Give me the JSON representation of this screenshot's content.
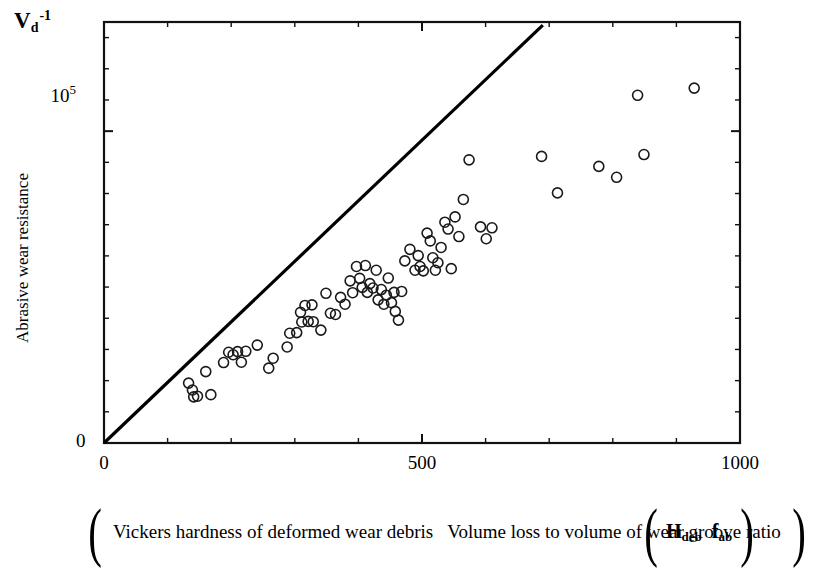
{
  "figure": {
    "corner_symbol": {
      "base": "V",
      "subscript": "d",
      "superscript": "-1"
    },
    "y_axis_title": "Abrasive wear resistance",
    "x_axis_expression": {
      "open_paren": "(",
      "numerator": "Vickers hardness of deformed wear debris",
      "denominator": "Volume loss to volume of wear groove ratio",
      "close_paren": ")"
    },
    "x_axis_symbol": {
      "open_paren": "(",
      "numerator_base": "H",
      "numerator_sub": "deb",
      "denominator_base": "f",
      "denominator_sub": "ab",
      "close_paren": ")"
    }
  },
  "chart_data": {
    "type": "scatter",
    "title": "",
    "subtitle": "",
    "xlabel": "Vickers hardness of deformed wear debris / Volume loss to volume of wear groove ratio (H_deb / f_ab)",
    "ylabel": "Abrasive wear resistance (V_d^-1)",
    "xlim": [
      0,
      1000
    ],
    "ylim": [
      0,
      135000
    ],
    "grid": false,
    "legend": null,
    "x_ticks": [
      {
        "value": 0,
        "label": "0",
        "major": true
      },
      {
        "value": 100,
        "label": "",
        "major": false
      },
      {
        "value": 200,
        "label": "",
        "major": false
      },
      {
        "value": 300,
        "label": "",
        "major": false
      },
      {
        "value": 400,
        "label": "",
        "major": false
      },
      {
        "value": 500,
        "label": "500",
        "major": true
      },
      {
        "value": 600,
        "label": "",
        "major": false
      },
      {
        "value": 700,
        "label": "",
        "major": false
      },
      {
        "value": 800,
        "label": "",
        "major": false
      },
      {
        "value": 900,
        "label": "",
        "major": false
      },
      {
        "value": 1000,
        "label": "1000",
        "major": true
      }
    ],
    "y_ticks": [
      {
        "value": 0,
        "label": "0",
        "major": true
      },
      {
        "value": 10000,
        "label": "",
        "major": false
      },
      {
        "value": 20000,
        "label": "",
        "major": false
      },
      {
        "value": 30000,
        "label": "",
        "major": false
      },
      {
        "value": 40000,
        "label": "",
        "major": false
      },
      {
        "value": 50000,
        "label": "",
        "major": false
      },
      {
        "value": 60000,
        "label": "",
        "major": false
      },
      {
        "value": 70000,
        "label": "",
        "major": false
      },
      {
        "value": 80000,
        "label": "",
        "major": false
      },
      {
        "value": 90000,
        "label": "",
        "major": false
      },
      {
        "value": 100000,
        "label": "10^5",
        "major": true
      },
      {
        "value": 110000,
        "label": "",
        "major": false
      },
      {
        "value": 120000,
        "label": "",
        "major": false
      },
      {
        "value": 130000,
        "label": "",
        "major": false
      }
    ],
    "y_tick_1e5_label": {
      "mantissa": "10",
      "exponent": "5"
    },
    "trend_line": {
      "label": "linear fit through origin",
      "x_start": 0,
      "y_start": 0,
      "x_end": 690,
      "y_end": 134000,
      "color": "#000000",
      "width": 3.2
    },
    "marker": {
      "shape": "open-circle",
      "radius": 5,
      "stroke": "#1a1a1a",
      "stroke_width": 1.6,
      "fill": "none"
    },
    "points": [
      [
        133,
        19200
      ],
      [
        139,
        17000
      ],
      [
        141,
        14800
      ],
      [
        147,
        15000
      ],
      [
        160,
        22900
      ],
      [
        168,
        15500
      ],
      [
        188,
        25800
      ],
      [
        196,
        29100
      ],
      [
        203,
        28300
      ],
      [
        210,
        29300
      ],
      [
        216,
        25900
      ],
      [
        223,
        29400
      ],
      [
        241,
        31400
      ],
      [
        259,
        24000
      ],
      [
        266,
        27200
      ],
      [
        288,
        30800
      ],
      [
        292,
        35200
      ],
      [
        303,
        35400
      ],
      [
        309,
        41900
      ],
      [
        311,
        38800
      ],
      [
        316,
        44100
      ],
      [
        321,
        39000
      ],
      [
        327,
        44300
      ],
      [
        329,
        38900
      ],
      [
        341,
        36200
      ],
      [
        349,
        48000
      ],
      [
        356,
        41600
      ],
      [
        364,
        41200
      ],
      [
        372,
        46700
      ],
      [
        379,
        44500
      ],
      [
        387,
        52000
      ],
      [
        391,
        48200
      ],
      [
        397,
        56600
      ],
      [
        402,
        52800
      ],
      [
        406,
        49900
      ],
      [
        411,
        56900
      ],
      [
        414,
        48300
      ],
      [
        418,
        51100
      ],
      [
        423,
        49700
      ],
      [
        428,
        55400
      ],
      [
        431,
        45900
      ],
      [
        436,
        49200
      ],
      [
        440,
        44500
      ],
      [
        444,
        47400
      ],
      [
        447,
        52900
      ],
      [
        452,
        45000
      ],
      [
        456,
        48300
      ],
      [
        458,
        42200
      ],
      [
        463,
        39400
      ],
      [
        468,
        48600
      ],
      [
        473,
        58400
      ],
      [
        481,
        62100
      ],
      [
        489,
        55400
      ],
      [
        494,
        60100
      ],
      [
        497,
        56600
      ],
      [
        502,
        55200
      ],
      [
        508,
        67300
      ],
      [
        513,
        64800
      ],
      [
        517,
        59400
      ],
      [
        521,
        55400
      ],
      [
        525,
        57800
      ],
      [
        530,
        62700
      ],
      [
        536,
        70800
      ],
      [
        541,
        68600
      ],
      [
        546,
        55900
      ],
      [
        552,
        72500
      ],
      [
        558,
        66200
      ],
      [
        565,
        78100
      ],
      [
        574,
        90800
      ],
      [
        592,
        69300
      ],
      [
        601,
        65500
      ],
      [
        610,
        69000
      ],
      [
        688,
        91900
      ],
      [
        713,
        80200
      ],
      [
        778,
        88700
      ],
      [
        806,
        85200
      ],
      [
        839,
        111500
      ],
      [
        849,
        92500
      ],
      [
        928,
        113800
      ]
    ]
  }
}
